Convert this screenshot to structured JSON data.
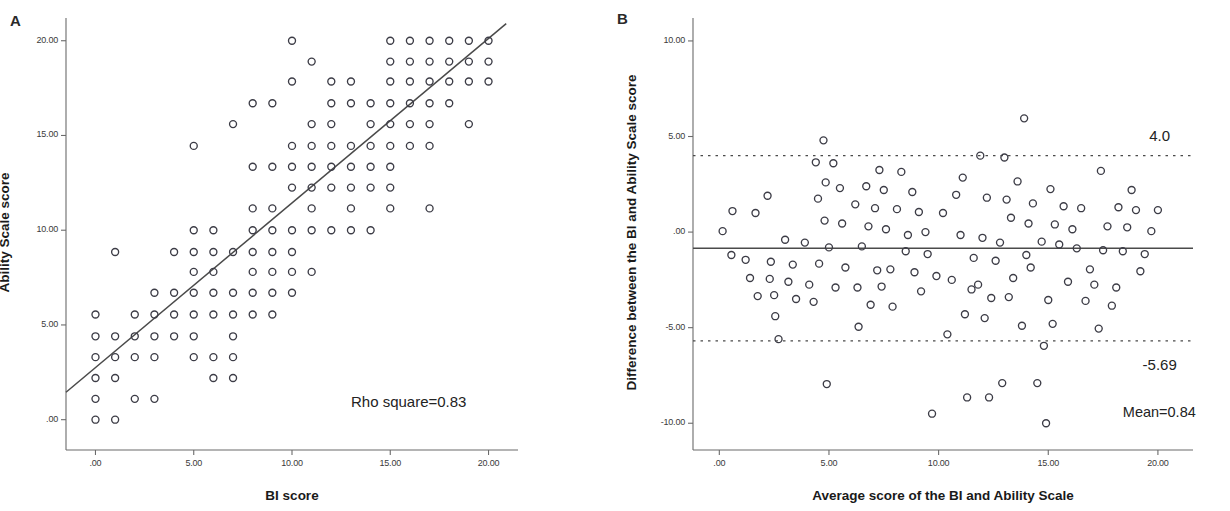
{
  "figure": {
    "background_color": "#ffffff",
    "marker_color": "#3c3c46",
    "line_color": "#4a4a4a",
    "axis_color": "#6b6b6b"
  },
  "panels": [
    {
      "id": "A",
      "letter": "A",
      "chart_ref": 0
    },
    {
      "id": "B",
      "letter": "B",
      "chart_ref": 1
    }
  ],
  "chart_data": [
    {
      "type": "scatter",
      "panel": "A",
      "title": "",
      "xlabel": "BI score",
      "ylabel": "Ability Scale score",
      "xlim": [
        -1.5,
        21.5
      ],
      "ylim": [
        -1.6,
        21.2
      ],
      "xticks": [
        0,
        5,
        10,
        15,
        20
      ],
      "xticklabels": [
        ".00",
        "5.00",
        "10.00",
        "15.00",
        "20.00"
      ],
      "yticks": [
        0,
        5,
        10,
        15,
        20
      ],
      "yticklabels": [
        ".00",
        "5.00",
        "10.00",
        "15.00",
        "20.00"
      ],
      "grid": false,
      "legend": "none",
      "annotations": [
        {
          "name": "rho-square-annotation",
          "text": "Rho square=0.83",
          "x": 13.0,
          "y": 0.9
        }
      ],
      "fit_line": {
        "name": "regression-line",
        "x0": -1.5,
        "y0": 1.45,
        "x1": 20.9,
        "y1": 20.9,
        "style": "solid"
      },
      "points": [
        [
          0,
          0
        ],
        [
          1,
          0
        ],
        [
          0,
          1.1
        ],
        [
          2,
          1.1
        ],
        [
          3,
          1.1
        ],
        [
          0,
          2.2
        ],
        [
          1,
          2.2
        ],
        [
          6,
          2.2
        ],
        [
          7,
          2.2
        ],
        [
          0,
          3.3
        ],
        [
          1,
          3.3
        ],
        [
          2,
          3.3
        ],
        [
          3,
          3.3
        ],
        [
          5,
          3.3
        ],
        [
          6,
          3.3
        ],
        [
          7,
          3.3
        ],
        [
          0,
          4.4
        ],
        [
          1,
          4.4
        ],
        [
          2,
          4.4
        ],
        [
          3,
          4.4
        ],
        [
          4,
          4.4
        ],
        [
          5,
          4.4
        ],
        [
          7,
          4.4
        ],
        [
          0,
          5.55
        ],
        [
          2,
          5.55
        ],
        [
          3,
          5.55
        ],
        [
          4,
          5.55
        ],
        [
          5,
          5.55
        ],
        [
          6,
          5.55
        ],
        [
          7,
          5.55
        ],
        [
          8,
          5.55
        ],
        [
          9,
          5.55
        ],
        [
          3,
          6.7
        ],
        [
          4,
          6.7
        ],
        [
          5,
          6.7
        ],
        [
          6,
          6.7
        ],
        [
          7,
          6.7
        ],
        [
          8,
          6.7
        ],
        [
          9,
          6.7
        ],
        [
          10,
          6.7
        ],
        [
          5,
          7.8
        ],
        [
          6,
          7.8
        ],
        [
          8,
          7.8
        ],
        [
          9,
          7.8
        ],
        [
          10,
          7.8
        ],
        [
          11,
          7.8
        ],
        [
          1,
          8.85
        ],
        [
          4,
          8.85
        ],
        [
          5,
          8.85
        ],
        [
          6,
          8.85
        ],
        [
          7,
          8.85
        ],
        [
          8,
          8.85
        ],
        [
          9,
          8.85
        ],
        [
          10,
          8.85
        ],
        [
          5,
          10.0
        ],
        [
          6,
          10.0
        ],
        [
          8,
          10.0
        ],
        [
          9,
          10.0
        ],
        [
          10,
          10.0
        ],
        [
          11,
          10.0
        ],
        [
          12,
          10.0
        ],
        [
          13,
          10.0
        ],
        [
          14,
          10.0
        ],
        [
          8,
          11.15
        ],
        [
          9,
          11.15
        ],
        [
          11,
          11.15
        ],
        [
          13,
          11.15
        ],
        [
          15,
          11.15
        ],
        [
          17,
          11.15
        ],
        [
          10,
          12.25
        ],
        [
          11,
          12.25
        ],
        [
          12,
          12.25
        ],
        [
          13,
          12.25
        ],
        [
          14,
          12.25
        ],
        [
          15,
          12.25
        ],
        [
          8,
          13.35
        ],
        [
          9,
          13.35
        ],
        [
          10,
          13.35
        ],
        [
          11,
          13.35
        ],
        [
          12,
          13.35
        ],
        [
          13,
          13.35
        ],
        [
          14,
          13.35
        ],
        [
          15,
          13.35
        ],
        [
          5,
          14.45
        ],
        [
          10,
          14.45
        ],
        [
          11,
          14.45
        ],
        [
          12,
          14.45
        ],
        [
          13,
          14.45
        ],
        [
          14,
          14.45
        ],
        [
          15,
          14.45
        ],
        [
          16,
          14.45
        ],
        [
          17,
          14.45
        ],
        [
          7,
          15.6
        ],
        [
          11,
          15.6
        ],
        [
          12,
          15.6
        ],
        [
          14,
          15.6
        ],
        [
          15,
          15.6
        ],
        [
          16,
          15.6
        ],
        [
          17,
          15.6
        ],
        [
          19,
          15.6
        ],
        [
          8,
          16.7
        ],
        [
          9,
          16.7
        ],
        [
          12,
          16.7
        ],
        [
          13,
          16.7
        ],
        [
          14,
          16.7
        ],
        [
          15,
          16.7
        ],
        [
          16,
          16.7
        ],
        [
          17,
          16.7
        ],
        [
          18,
          16.7
        ],
        [
          10,
          17.85
        ],
        [
          12,
          17.85
        ],
        [
          13,
          17.85
        ],
        [
          15,
          17.85
        ],
        [
          16,
          17.85
        ],
        [
          17,
          17.85
        ],
        [
          18,
          17.85
        ],
        [
          19,
          17.85
        ],
        [
          20,
          17.85
        ],
        [
          11,
          18.9
        ],
        [
          15,
          18.9
        ],
        [
          16,
          18.9
        ],
        [
          17,
          18.9
        ],
        [
          18,
          18.9
        ],
        [
          19,
          18.9
        ],
        [
          20,
          18.9
        ],
        [
          10,
          20.0
        ],
        [
          15,
          20.0
        ],
        [
          16,
          20.0
        ],
        [
          17,
          20.0
        ],
        [
          18,
          20.0
        ],
        [
          19,
          20.0
        ],
        [
          20,
          20.0
        ]
      ]
    },
    {
      "type": "scatter",
      "panel": "B",
      "title": "",
      "xlabel": "Average score of the BI and Ability Scale",
      "ylabel": "Difference between the BI and Ability Scale score",
      "xlim": [
        -1.2,
        21.6
      ],
      "ylim": [
        -11.4,
        11.2
      ],
      "xticks": [
        0,
        5,
        10,
        15,
        20
      ],
      "xticklabels": [
        ".00",
        "5.00",
        "10.00",
        "15.00",
        "20.00"
      ],
      "yticks": [
        -10,
        -5,
        0,
        5,
        10
      ],
      "yticklabels": [
        "-10.00",
        "-5.00",
        ".00",
        "5.00",
        "10.00"
      ],
      "grid": false,
      "legend": "none",
      "reference_lines": [
        {
          "name": "upper-limit-of-agreement-line",
          "value": 4.0,
          "style": "dotted",
          "label": "4.0"
        },
        {
          "name": "mean-difference-line",
          "value": -0.84,
          "style": "solid",
          "label": "Mean=0.84"
        },
        {
          "name": "lower-limit-of-agreement-line",
          "value": -5.69,
          "style": "dotted",
          "label": "-5.69"
        }
      ],
      "annotations": [
        {
          "name": "upper-limit-label",
          "text": "4.0",
          "x": 19.6,
          "y": 4.95
        },
        {
          "name": "lower-limit-label",
          "text": "-5.69",
          "x": 19.3,
          "y": -7.0
        },
        {
          "name": "mean-label",
          "text": "Mean=0.84",
          "x": 18.4,
          "y": -9.5
        }
      ],
      "points": [
        [
          0.15,
          0.05
        ],
        [
          0.6,
          1.1
        ],
        [
          0.55,
          -1.2
        ],
        [
          1.2,
          -1.45
        ],
        [
          1.4,
          -2.4
        ],
        [
          1.65,
          1.0
        ],
        [
          1.75,
          -3.35
        ],
        [
          2.2,
          1.9
        ],
        [
          2.3,
          -2.45
        ],
        [
          2.35,
          -1.55
        ],
        [
          2.5,
          -3.3
        ],
        [
          2.55,
          -4.4
        ],
        [
          2.7,
          -5.6
        ],
        [
          3.0,
          -0.4
        ],
        [
          3.15,
          -2.6
        ],
        [
          3.35,
          -1.7
        ],
        [
          3.5,
          -3.5
        ],
        [
          3.9,
          -0.55
        ],
        [
          4.1,
          -2.75
        ],
        [
          4.3,
          -3.65
        ],
        [
          4.4,
          3.65
        ],
        [
          4.5,
          1.75
        ],
        [
          4.55,
          -1.65
        ],
        [
          4.75,
          4.8
        ],
        [
          4.8,
          0.6
        ],
        [
          4.85,
          2.6
        ],
        [
          4.9,
          -7.95
        ],
        [
          5.0,
          -0.8
        ],
        [
          5.2,
          3.6
        ],
        [
          5.3,
          -2.9
        ],
        [
          5.5,
          2.3
        ],
        [
          5.6,
          0.45
        ],
        [
          5.75,
          -1.85
        ],
        [
          6.2,
          1.45
        ],
        [
          6.3,
          -2.9
        ],
        [
          6.35,
          -4.95
        ],
        [
          6.5,
          -0.75
        ],
        [
          6.7,
          2.4
        ],
        [
          6.8,
          0.3
        ],
        [
          6.9,
          -3.8
        ],
        [
          7.1,
          1.25
        ],
        [
          7.2,
          -2.0
        ],
        [
          7.3,
          3.25
        ],
        [
          7.4,
          -2.85
        ],
        [
          7.5,
          2.2
        ],
        [
          7.6,
          0.15
        ],
        [
          7.8,
          -1.95
        ],
        [
          7.9,
          -3.9
        ],
        [
          8.1,
          1.2
        ],
        [
          8.3,
          3.15
        ],
        [
          8.5,
          -1.0
        ],
        [
          8.6,
          -0.15
        ],
        [
          8.8,
          2.1
        ],
        [
          8.9,
          -2.1
        ],
        [
          9.1,
          1.05
        ],
        [
          9.2,
          -3.1
        ],
        [
          9.4,
          0.0
        ],
        [
          9.5,
          -1.15
        ],
        [
          9.7,
          -9.5
        ],
        [
          9.9,
          -2.3
        ],
        [
          10.2,
          1.0
        ],
        [
          10.4,
          -5.35
        ],
        [
          10.6,
          -2.5
        ],
        [
          10.8,
          1.95
        ],
        [
          11.0,
          -0.15
        ],
        [
          11.1,
          2.85
        ],
        [
          11.2,
          -4.3
        ],
        [
          11.3,
          -8.65
        ],
        [
          11.5,
          -3.0
        ],
        [
          11.6,
          -1.35
        ],
        [
          11.8,
          -2.75
        ],
        [
          11.9,
          4.0
        ],
        [
          12.0,
          -0.3
        ],
        [
          12.1,
          -4.5
        ],
        [
          12.2,
          1.8
        ],
        [
          12.3,
          -8.65
        ],
        [
          12.4,
          -3.45
        ],
        [
          12.6,
          -1.5
        ],
        [
          12.8,
          -0.55
        ],
        [
          12.9,
          -7.9
        ],
        [
          13.0,
          3.9
        ],
        [
          13.1,
          1.7
        ],
        [
          13.2,
          -3.4
        ],
        [
          13.3,
          0.75
        ],
        [
          13.4,
          -2.4
        ],
        [
          13.6,
          2.65
        ],
        [
          13.8,
          -4.9
        ],
        [
          13.9,
          5.95
        ],
        [
          14.0,
          -1.2
        ],
        [
          14.1,
          0.45
        ],
        [
          14.2,
          -1.85
        ],
        [
          14.3,
          1.5
        ],
        [
          14.5,
          -7.9
        ],
        [
          14.7,
          -0.5
        ],
        [
          14.8,
          -5.95
        ],
        [
          14.9,
          -10.0
        ],
        [
          15.0,
          -3.55
        ],
        [
          15.1,
          2.25
        ],
        [
          15.2,
          -4.8
        ],
        [
          15.3,
          0.4
        ],
        [
          15.5,
          -0.65
        ],
        [
          15.7,
          1.35
        ],
        [
          15.9,
          -2.6
        ],
        [
          16.1,
          0.15
        ],
        [
          16.3,
          -0.85
        ],
        [
          16.5,
          1.25
        ],
        [
          16.7,
          -3.6
        ],
        [
          16.9,
          -1.95
        ],
        [
          17.1,
          -2.75
        ],
        [
          17.3,
          -5.05
        ],
        [
          17.4,
          3.2
        ],
        [
          17.5,
          -0.95
        ],
        [
          17.7,
          0.3
        ],
        [
          17.9,
          -3.85
        ],
        [
          18.1,
          -2.9
        ],
        [
          18.2,
          1.3
        ],
        [
          18.4,
          -1.0
        ],
        [
          18.6,
          0.25
        ],
        [
          18.8,
          2.2
        ],
        [
          19.0,
          1.15
        ],
        [
          19.2,
          -2.05
        ],
        [
          19.4,
          -1.15
        ],
        [
          19.7,
          0.05
        ],
        [
          20.0,
          1.15
        ]
      ]
    }
  ]
}
